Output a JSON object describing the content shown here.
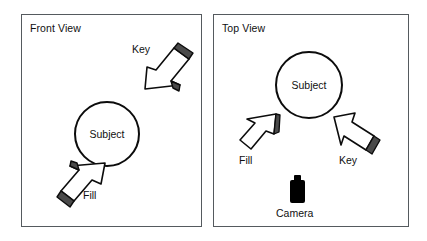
{
  "figure": {
    "background_color": "#ffffff",
    "line_color": "#0c0c0c",
    "panel_border_color": "#555a5e",
    "shadow_edge_color": "#4a4a4a"
  },
  "panels": [
    {
      "id": "front-view",
      "title": "Front View",
      "subject": {
        "label": "Subject"
      },
      "lights": [
        {
          "name": "Key",
          "label": "Key",
          "direction": "down-left",
          "icon": "arrow-3d-icon"
        },
        {
          "name": "Fill",
          "label": "Fill",
          "direction": "up-right",
          "icon": "arrow-3d-icon"
        }
      ]
    },
    {
      "id": "top-view",
      "title": "Top View",
      "subject": {
        "label": "Subject"
      },
      "lights": [
        {
          "name": "Fill",
          "label": "Fill",
          "direction": "up-right",
          "icon": "arrow-3d-icon"
        },
        {
          "name": "Key",
          "label": "Key",
          "direction": "up-left",
          "icon": "arrow-3d-icon"
        }
      ],
      "camera": {
        "label": "Camera",
        "icon": "camera-icon"
      }
    }
  ]
}
